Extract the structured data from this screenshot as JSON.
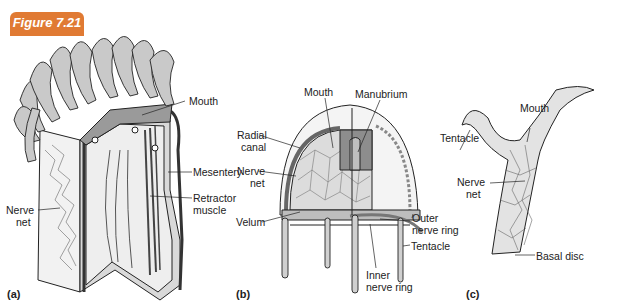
{
  "figure": {
    "badge": "Figure 7.21"
  },
  "panels": {
    "a": {
      "letter": "(a)",
      "labels": {
        "mouth": "Mouth",
        "mesentery": "Mesentery",
        "retractor_muscle_1": "Retractor",
        "retractor_muscle_2": "muscle",
        "nerve_net_1": "Nerve",
        "nerve_net_2": "net"
      }
    },
    "b": {
      "letter": "(b)",
      "labels": {
        "mouth": "Mouth",
        "manubrium": "Manubrium",
        "radial_canal_1": "Radial",
        "radial_canal_2": "canal",
        "nerve_net_1": "Nerve",
        "nerve_net_2": "net",
        "velum": "Velum",
        "outer_nerve_ring_1": "Outer",
        "outer_nerve_ring_2": "nerve ring",
        "tentacle": "Tentacle",
        "inner_nerve_ring_1": "Inner",
        "inner_nerve_ring_2": "nerve ring"
      }
    },
    "c": {
      "letter": "(c)",
      "labels": {
        "tentacle": "Tentacle",
        "mouth": "Mouth",
        "nerve_net_1": "Nerve",
        "nerve_net_2": "net",
        "basal_disc": "Basal disc"
      }
    }
  },
  "colors": {
    "badge": "#e07a33",
    "fill_light": "#e6e6e6",
    "fill_mid": "#bdbdbd",
    "fill_dark": "#8a8a8a",
    "stroke": "#222222"
  }
}
